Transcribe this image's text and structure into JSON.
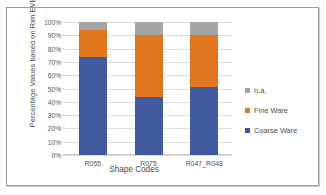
{
  "chart_data": {
    "type": "bar",
    "subtype": "stacked-100-percent",
    "title": "",
    "xlabel": "Shape Codes",
    "ylabel": "Percentage Values based on Rim EVEs",
    "categories": [
      "R055",
      "R075",
      "R047_R048"
    ],
    "series": [
      {
        "name": "Coarse Ware",
        "color": "#41599F",
        "values": [
          74,
          43.5,
          51.5
        ]
      },
      {
        "name": "Fine Ware",
        "color": "#E0761E",
        "values": [
          20,
          46.5,
          38.5
        ]
      },
      {
        "name": "n.a.",
        "color": "#A5A5A5",
        "values": [
          6,
          10,
          10
        ]
      }
    ],
    "stack_order_bottom_to_top": [
      "Coarse Ware",
      "Fine Ware",
      "n.a."
    ],
    "ylim": [
      0,
      100
    ],
    "yticks": [
      "0%",
      "10%",
      "20%",
      "30%",
      "40%",
      "50%",
      "60%",
      "70%",
      "80%",
      "90%",
      "100%"
    ],
    "ytick_values": [
      0,
      10,
      20,
      30,
      40,
      50,
      60,
      70,
      80,
      90,
      100
    ],
    "grid": true,
    "legend_position": "right",
    "legend_entries": [
      {
        "label": "n.a.",
        "color": "#A5A5A5"
      },
      {
        "label": "Fine Ware",
        "color": "#E0761E"
      },
      {
        "label": "Coarse Ware",
        "color": "#41599F"
      }
    ]
  }
}
